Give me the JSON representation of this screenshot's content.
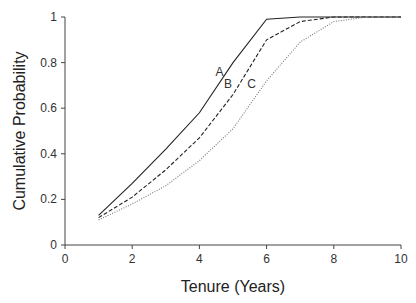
{
  "chart_data": {
    "type": "line",
    "title": "",
    "xlabel": "Tenure (Years)",
    "ylabel": "Cumulative Probability",
    "xlim": [
      0,
      10
    ],
    "ylim": [
      0,
      1
    ],
    "xticks": [
      "0",
      "2",
      "4",
      "6",
      "8",
      "10"
    ],
    "yticks": [
      "0",
      "0.2",
      "0.4",
      "0.6",
      "0.8",
      "1"
    ],
    "grid": false,
    "legend": "none (inline curve labels A, B, C)",
    "x": [
      1,
      2,
      3,
      4,
      5,
      6,
      7,
      8,
      9,
      10
    ],
    "series": [
      {
        "name": "A",
        "style": "solid",
        "values": [
          0.13,
          0.27,
          0.42,
          0.58,
          0.8,
          0.99,
          1.0,
          1.0,
          1.0,
          1.0
        ]
      },
      {
        "name": "B",
        "style": "dashed",
        "values": [
          0.12,
          0.21,
          0.33,
          0.47,
          0.66,
          0.9,
          0.98,
          1.0,
          1.0,
          1.0
        ]
      },
      {
        "name": "C",
        "style": "dotted",
        "values": [
          0.11,
          0.18,
          0.26,
          0.37,
          0.51,
          0.72,
          0.89,
          0.98,
          1.0,
          1.0
        ]
      }
    ],
    "annotations": [
      {
        "text": "A",
        "x": 4.6,
        "y": 0.74
      },
      {
        "text": "B",
        "x": 4.85,
        "y": 0.69
      },
      {
        "text": "C",
        "x": 5.55,
        "y": 0.69
      }
    ]
  }
}
